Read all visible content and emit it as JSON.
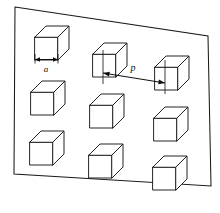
{
  "figure": {
    "background_color": "#ffffff",
    "line_color": "#1a1a1a",
    "face_color": "#ffffff"
  },
  "substrate": {
    "name": "substrate-plane",
    "corners": "15,7 208,36 211,186 14,174"
  },
  "annotations": {
    "edge_width": {
      "label": "a",
      "name": "cube-edge-width",
      "label_x": 46,
      "label_y": 69.5,
      "line_y": 59.5,
      "x_start": 35,
      "x_end": 58
    },
    "pitch": {
      "label": "p",
      "name": "cube-pitch",
      "label_x": 133,
      "label_y": 69,
      "x_start": 103,
      "y_start": 73,
      "x_end": 165,
      "y_end": 83,
      "ext_top_1": 50,
      "ext_bot_1": 84,
      "ext_top_2": 60,
      "ext_bot_2": 94
    }
  },
  "cubes": [
    {
      "id": "cube-r1c1",
      "x": 35,
      "y": 26,
      "size": 23,
      "depth": 11
    },
    {
      "id": "cube-r1c2",
      "x": 93,
      "y": 43,
      "size": 23,
      "depth": 11
    },
    {
      "id": "cube-r1c3",
      "x": 155,
      "y": 56,
      "size": 23,
      "depth": 11
    },
    {
      "id": "cube-r2c1",
      "x": 31,
      "y": 81,
      "size": 23,
      "depth": 11
    },
    {
      "id": "cube-r2c2",
      "x": 90,
      "y": 94,
      "size": 23,
      "depth": 11
    },
    {
      "id": "cube-r2c3",
      "x": 154,
      "y": 107,
      "size": 23,
      "depth": 11
    },
    {
      "id": "cube-r3c1",
      "x": 30,
      "y": 131,
      "size": 23,
      "depth": 11
    },
    {
      "id": "cube-r3c2",
      "x": 89,
      "y": 144,
      "size": 23,
      "depth": 11
    },
    {
      "id": "cube-r3c3",
      "x": 153,
      "y": 156,
      "size": 23,
      "depth": 11
    }
  ]
}
